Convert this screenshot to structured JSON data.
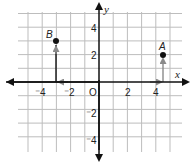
{
  "diagram": {
    "type": "coordinate-plane",
    "axes": {
      "x_label": "x",
      "y_label": "y",
      "origin_label": "O",
      "x_ticks": [
        {
          "value": -4,
          "label": "⁻4"
        },
        {
          "value": -2,
          "label": "⁻2"
        },
        {
          "value": 2,
          "label": "2"
        },
        {
          "value": 4,
          "label": "4"
        }
      ],
      "y_ticks": [
        {
          "value": 4,
          "label": "4"
        },
        {
          "value": 2,
          "label": "2"
        },
        {
          "value": -2,
          "label": "⁻2"
        },
        {
          "value": -4,
          "label": "⁻4"
        }
      ],
      "x_range": [
        -5,
        5
      ],
      "y_range": [
        -4,
        5
      ]
    },
    "points": [
      {
        "name": "A",
        "x": 4.5,
        "y": 2
      },
      {
        "name": "B",
        "x": -3,
        "y": 3
      }
    ],
    "colors": {
      "axis": "#111111",
      "grid": "#bdbdbd",
      "arrow": "#8a8a8a",
      "point": "#111111"
    }
  }
}
